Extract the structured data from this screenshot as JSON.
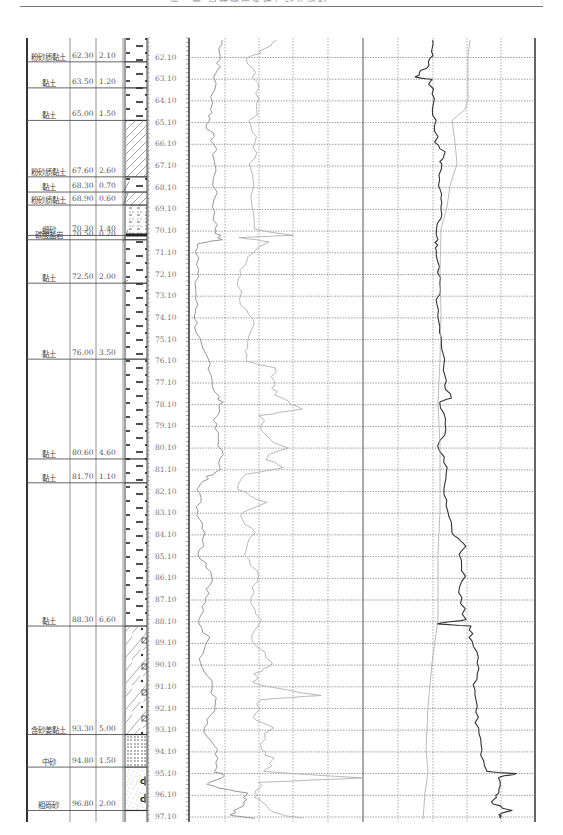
{
  "page": {
    "header_text": "第三章 自然地质条件与钻孔资料"
  },
  "layers": [
    {
      "name": "粉砂质黏土",
      "bottom_depth": "62.30",
      "thickness": "2.10",
      "top": 62.3,
      "pattern": "clay"
    },
    {
      "name": "黏土",
      "bottom_depth": "63.50",
      "thickness": "1.20",
      "top": 63.5,
      "pattern": "clay"
    },
    {
      "name": "黏土",
      "bottom_depth": "65.00",
      "thickness": "1.50",
      "top": 65.0,
      "pattern": "clay"
    },
    {
      "name": "粉砂质黏土",
      "bottom_depth": "67.60",
      "thickness": "2.60",
      "top": 67.6,
      "pattern": "silty-clay"
    },
    {
      "name": "黏土",
      "bottom_depth": "68.30",
      "thickness": "0.70",
      "top": 68.3,
      "pattern": "clay"
    },
    {
      "name": "粉砂质黏土",
      "bottom_depth": "68.90",
      "thickness": "0.60",
      "top": 68.9,
      "pattern": "silty-clay"
    },
    {
      "name": "细砂",
      "bottom_depth": "70.30",
      "thickness": "1.40",
      "top": 70.3,
      "pattern": "fine-sand"
    },
    {
      "name": "碳酸盐岩",
      "bottom_depth": "70.50",
      "thickness": "0.20",
      "top": 70.5,
      "pattern": "carbonate"
    },
    {
      "name": "黏土",
      "bottom_depth": "72.50",
      "thickness": "2.00",
      "top": 72.5,
      "pattern": "clay"
    },
    {
      "name": "黏土",
      "bottom_depth": "76.00",
      "thickness": "3.50",
      "top": 76.0,
      "pattern": "clay"
    },
    {
      "name": "黏土",
      "bottom_depth": "80.60",
      "thickness": "4.60",
      "top": 80.6,
      "pattern": "clay"
    },
    {
      "name": "黏土",
      "bottom_depth": "81.70",
      "thickness": "1.10",
      "top": 81.7,
      "pattern": "clay"
    },
    {
      "name": "黏土",
      "bottom_depth": "88.30",
      "thickness": "6.60",
      "top": 88.3,
      "pattern": "clay"
    },
    {
      "name": "含砂姜黏土",
      "bottom_depth": "93.30",
      "thickness": "5.00",
      "top": 93.3,
      "pattern": "calcareous-clay"
    },
    {
      "name": "中砂",
      "bottom_depth": "94.80",
      "thickness": "1.50",
      "top": 94.8,
      "pattern": "medium-sand"
    },
    {
      "name": "粗砾砂",
      "bottom_depth": "96.80",
      "thickness": "2.00",
      "top": 96.8,
      "pattern": "gravel-sand"
    }
  ],
  "depth_scale": {
    "labels": [
      "62.10",
      "63.10",
      "64.10",
      "65.10",
      "66.10",
      "67.10",
      "68.10",
      "69.10",
      "70.10",
      "71.10",
      "72.10",
      "73.10",
      "74.10",
      "75.10",
      "76.10",
      "77.10",
      "78.10",
      "79.10",
      "80.10",
      "81.10",
      "82.10",
      "83.10",
      "84.10",
      "85.10",
      "86.10",
      "87.10",
      "88.10",
      "89.10",
      "90.10",
      "91.10",
      "92.10",
      "93.10",
      "94.10",
      "95.10",
      "96.10",
      "97.10"
    ],
    "start": 62.1,
    "end": 97.1,
    "step": 1.0
  },
  "log_tracks": {
    "left_track": {
      "curves": [
        "curve-1-dark-gray",
        "curve-2-light-gray"
      ]
    },
    "right_track": {
      "curves": [
        "curve-3-black",
        "curve-4-light-gray"
      ]
    }
  },
  "colors": {
    "grid": "#888888",
    "curve_gray": "#8a8a8a",
    "curve_light": "#b0b0b0",
    "curve_dark": "#333333",
    "border": "#555555"
  }
}
